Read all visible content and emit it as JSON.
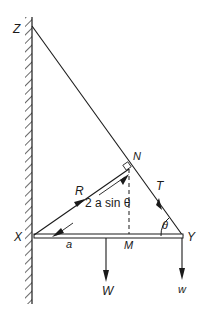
{
  "diagram": {
    "type": "statics-free-body",
    "points": {
      "Z": {
        "label": "Z",
        "x": 32,
        "y": 52
      },
      "N": {
        "label": "N",
        "x": 130,
        "y": 166
      },
      "X": {
        "label": "X",
        "x": 34,
        "y": 236
      },
      "Y": {
        "label": "Y",
        "x": 183,
        "y": 236
      },
      "M": {
        "label": "M",
        "x": 129,
        "y": 236
      }
    },
    "labels": {
      "Z": "Z",
      "N": "N",
      "X": "X",
      "Y": "Y",
      "M": "M",
      "a": "a",
      "R": "R",
      "T": "T",
      "W": "W",
      "w": "w",
      "theta": "θ",
      "distance": "2 a sin θ"
    },
    "forces": [
      {
        "name": "R",
        "description": "reaction at hinge X, along XN"
      },
      {
        "name": "T",
        "description": "tension in string YZ"
      },
      {
        "name": "W",
        "description": "weight of rod at midpoint"
      },
      {
        "name": "w",
        "description": "load at end Y"
      }
    ],
    "colors": {
      "ink": "#1a1a1a",
      "background": "#ffffff"
    }
  }
}
